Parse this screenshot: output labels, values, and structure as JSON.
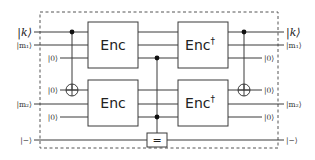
{
  "diagram": {
    "type": "quantum-circuit",
    "inputs": {
      "k": "|k⟩",
      "m1": "|m₁⟩",
      "anc1": "|0⟩",
      "anc2": "|0⟩",
      "m2": "|m₂⟩",
      "anc3": "|0⟩",
      "minus": "|−⟩"
    },
    "outputs": {
      "k": "|k⟩",
      "m1": "|m₁⟩",
      "anc1": "|0⟩",
      "anc2": "|0⟩",
      "m2": "|m₂⟩",
      "anc3": "|0⟩",
      "minus": "|−⟩"
    },
    "gates": {
      "enc_top": "Enc",
      "enc_bottom": "Enc",
      "enc_dagger_top": "Enc",
      "enc_dagger_bottom": "Enc",
      "dagger": "†",
      "equality": "="
    }
  }
}
